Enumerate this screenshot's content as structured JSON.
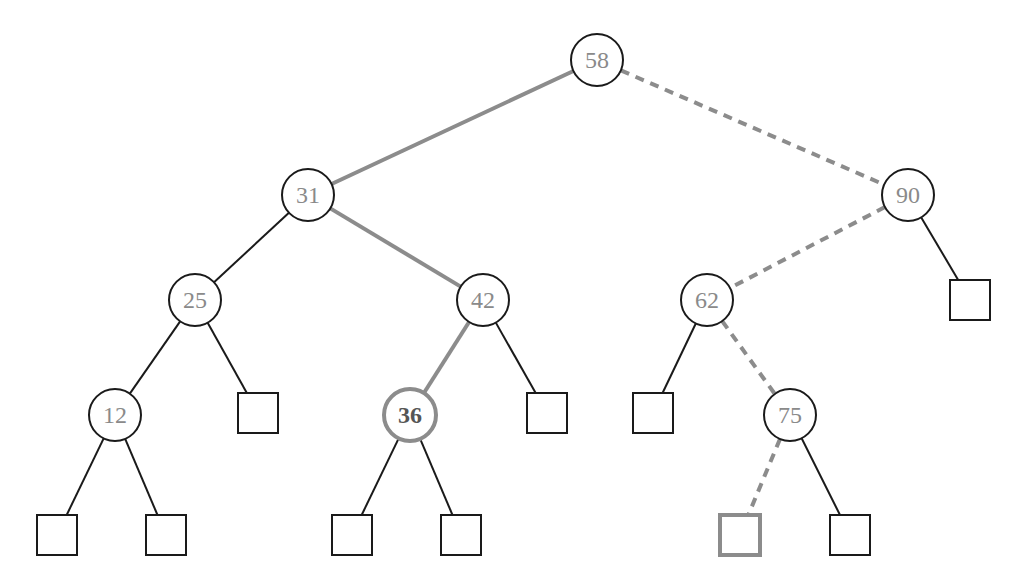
{
  "diagram": {
    "type": "binary-search-tree",
    "colors": {
      "normal_edge": "#1a1a1a",
      "highlight": "#8c8c8c",
      "node_stroke": "#1a1a1a",
      "node_text": "#8a8a8a",
      "background": "#ffffff"
    },
    "nodes": [
      {
        "id": "n58",
        "label": "58",
        "x": 597,
        "y": 60,
        "style": "normal"
      },
      {
        "id": "n31",
        "label": "31",
        "x": 308,
        "y": 195,
        "style": "normal"
      },
      {
        "id": "n90",
        "label": "90",
        "x": 908,
        "y": 195,
        "style": "normal"
      },
      {
        "id": "n25",
        "label": "25",
        "x": 195,
        "y": 300,
        "style": "normal"
      },
      {
        "id": "n42",
        "label": "42",
        "x": 483,
        "y": 300,
        "style": "normal"
      },
      {
        "id": "n62",
        "label": "62",
        "x": 707,
        "y": 300,
        "style": "normal"
      },
      {
        "id": "n12",
        "label": "12",
        "x": 115,
        "y": 415,
        "style": "normal"
      },
      {
        "id": "n36",
        "label": "36",
        "x": 410,
        "y": 415,
        "style": "highlight-bold"
      },
      {
        "id": "n75",
        "label": "75",
        "x": 790,
        "y": 415,
        "style": "normal"
      }
    ],
    "leaves": [
      {
        "id": "l25r",
        "x": 258,
        "y": 413,
        "style": "normal"
      },
      {
        "id": "l42r",
        "x": 547,
        "y": 413,
        "style": "normal"
      },
      {
        "id": "l62l",
        "x": 653,
        "y": 413,
        "style": "normal"
      },
      {
        "id": "l90r",
        "x": 970,
        "y": 300,
        "style": "normal"
      },
      {
        "id": "l12l",
        "x": 57,
        "y": 535,
        "style": "normal"
      },
      {
        "id": "l12r",
        "x": 166,
        "y": 535,
        "style": "normal"
      },
      {
        "id": "l36l",
        "x": 352,
        "y": 535,
        "style": "normal"
      },
      {
        "id": "l36r",
        "x": 461,
        "y": 535,
        "style": "normal"
      },
      {
        "id": "l75l",
        "x": 740,
        "y": 535,
        "style": "highlight"
      },
      {
        "id": "l75r",
        "x": 850,
        "y": 535,
        "style": "normal"
      }
    ],
    "edges": [
      {
        "from": "n58",
        "to": "n31",
        "style": "highlight-solid"
      },
      {
        "from": "n58",
        "to": "n90",
        "style": "highlight-dashed"
      },
      {
        "from": "n31",
        "to": "n25",
        "style": "normal"
      },
      {
        "from": "n31",
        "to": "n42",
        "style": "highlight-solid"
      },
      {
        "from": "n90",
        "to": "n62",
        "style": "highlight-dashed"
      },
      {
        "from": "n90",
        "to": "l90r",
        "style": "normal"
      },
      {
        "from": "n25",
        "to": "n12",
        "style": "normal"
      },
      {
        "from": "n25",
        "to": "l25r",
        "style": "normal"
      },
      {
        "from": "n42",
        "to": "n36",
        "style": "highlight-solid"
      },
      {
        "from": "n42",
        "to": "l42r",
        "style": "normal"
      },
      {
        "from": "n62",
        "to": "l62l",
        "style": "normal"
      },
      {
        "from": "n62",
        "to": "n75",
        "style": "highlight-dashed"
      },
      {
        "from": "n12",
        "to": "l12l",
        "style": "normal"
      },
      {
        "from": "n12",
        "to": "l12r",
        "style": "normal"
      },
      {
        "from": "n36",
        "to": "l36l",
        "style": "normal"
      },
      {
        "from": "n36",
        "to": "l36r",
        "style": "normal"
      },
      {
        "from": "n75",
        "to": "l75l",
        "style": "highlight-dashed"
      },
      {
        "from": "n75",
        "to": "l75r",
        "style": "normal"
      }
    ],
    "node_radius": 26,
    "leaf_size": 40
  }
}
